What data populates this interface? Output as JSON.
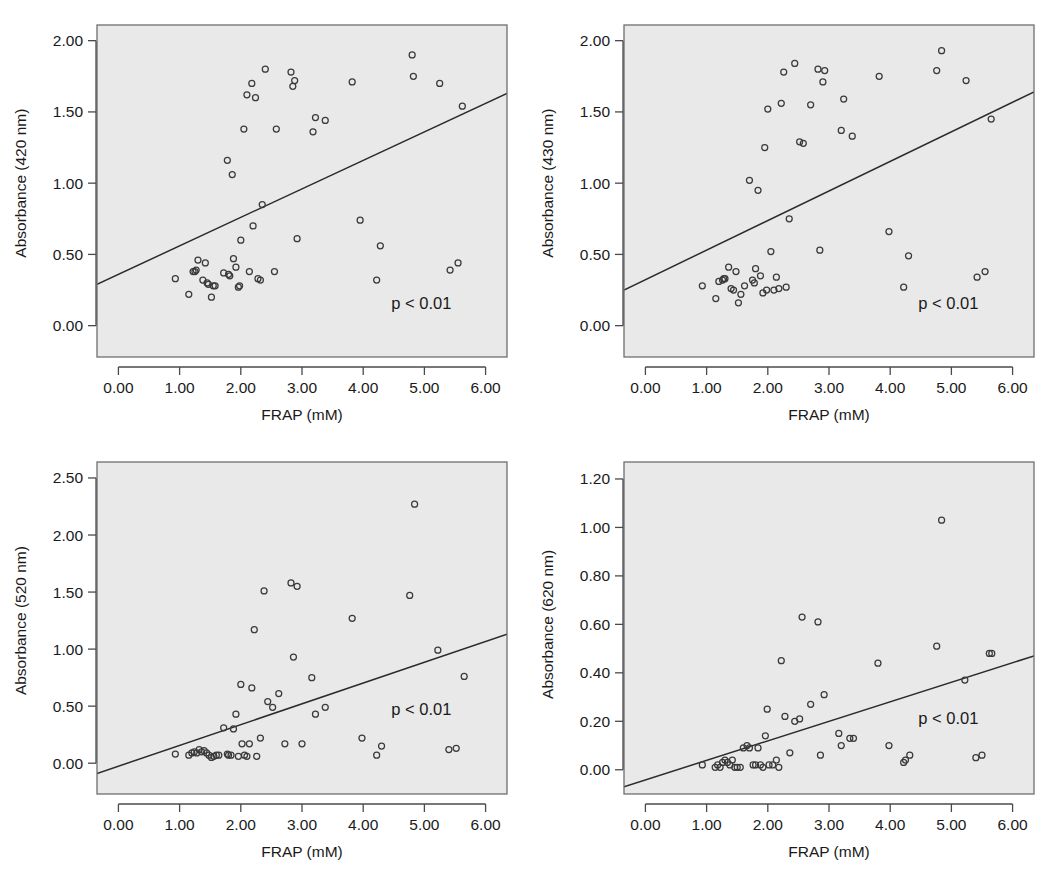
{
  "figure": {
    "name": "four-panel-scatter-figure",
    "panel_count": 4,
    "background_color": "#ffffff",
    "plot_area_color": "#e9e9e9",
    "point_color": "#3a3a3a",
    "line_color": "#2b2b2b"
  },
  "chart_data": [
    {
      "id": "panel-420",
      "type": "scatter",
      "title": "",
      "xlabel": "FRAP (mM)",
      "ylabel": "Absorbance (420 nm)",
      "xlim": [
        -0.35,
        6.35
      ],
      "ylim": [
        -0.22,
        2.11
      ],
      "xticks": [
        0.0,
        1.0,
        2.0,
        3.0,
        4.0,
        5.0,
        6.0
      ],
      "xticklabels": [
        "0.00",
        "1.00",
        "2.00",
        "3.00",
        "4.00",
        "5.00",
        "6.00"
      ],
      "yticks": [
        0.0,
        0.5,
        1.0,
        1.5,
        2.0
      ],
      "yticklabels": [
        "0.00",
        "0.50",
        "1.00",
        "1.50",
        "2.00"
      ],
      "grid": false,
      "legend": "none",
      "annotation": "p < 0.01",
      "annotation_x": 4.95,
      "annotation_y": 0.12,
      "fit_line": {
        "x": [
          -0.35,
          6.35
        ],
        "y": [
          0.29,
          1.63
        ]
      },
      "x": [
        0.93,
        1.15,
        1.22,
        1.25,
        1.27,
        1.3,
        1.38,
        1.42,
        1.45,
        1.47,
        1.52,
        1.55,
        1.58,
        1.72,
        1.78,
        1.8,
        1.82,
        1.86,
        1.88,
        1.92,
        1.96,
        1.98,
        2.0,
        2.05,
        2.1,
        2.14,
        2.18,
        2.2,
        2.24,
        2.28,
        2.32,
        2.35,
        2.4,
        2.55,
        2.58,
        2.82,
        2.85,
        2.88,
        2.92,
        3.18,
        3.22,
        3.38,
        3.82,
        3.95,
        4.22,
        4.28,
        4.8,
        4.82,
        5.25,
        5.42,
        5.55,
        5.62
      ],
      "y": [
        0.33,
        0.22,
        0.38,
        0.38,
        0.39,
        0.46,
        0.32,
        0.44,
        0.3,
        0.29,
        0.2,
        0.28,
        0.28,
        0.37,
        1.16,
        0.36,
        0.35,
        1.06,
        0.47,
        0.41,
        0.27,
        0.28,
        0.6,
        1.38,
        1.62,
        0.38,
        1.7,
        0.7,
        1.6,
        0.33,
        0.32,
        0.85,
        1.8,
        0.38,
        1.38,
        1.78,
        1.68,
        1.72,
        0.61,
        1.36,
        1.46,
        1.44,
        1.71,
        0.74,
        0.32,
        0.56,
        1.9,
        1.75,
        1.7,
        0.39,
        0.44,
        1.54
      ]
    },
    {
      "id": "panel-430",
      "type": "scatter",
      "title": "",
      "xlabel": "FRAP (mM)",
      "ylabel": "Absorbance (430 nm)",
      "xlim": [
        -0.35,
        6.35
      ],
      "ylim": [
        -0.22,
        2.11
      ],
      "xticks": [
        0.0,
        1.0,
        2.0,
        3.0,
        4.0,
        5.0,
        6.0
      ],
      "xticklabels": [
        "0.00",
        "1.00",
        "2.00",
        "3.00",
        "4.00",
        "5.00",
        "6.00"
      ],
      "yticks": [
        0.0,
        0.5,
        1.0,
        1.5,
        2.0
      ],
      "yticklabels": [
        "0.00",
        "0.50",
        "1.00",
        "1.50",
        "2.00"
      ],
      "grid": false,
      "legend": "none",
      "annotation": "p < 0.01",
      "annotation_x": 4.95,
      "annotation_y": 0.12,
      "fit_line": {
        "x": [
          -0.35,
          6.35
        ],
        "y": [
          0.25,
          1.64
        ]
      },
      "x": [
        0.93,
        1.15,
        1.2,
        1.26,
        1.28,
        1.3,
        1.36,
        1.4,
        1.44,
        1.48,
        1.52,
        1.56,
        1.62,
        1.7,
        1.75,
        1.78,
        1.8,
        1.84,
        1.88,
        1.92,
        1.95,
        1.98,
        2.0,
        2.05,
        2.1,
        2.14,
        2.18,
        2.22,
        2.26,
        2.3,
        2.35,
        2.44,
        2.52,
        2.58,
        2.7,
        2.82,
        2.85,
        2.9,
        2.93,
        3.2,
        3.24,
        3.38,
        3.82,
        3.98,
        4.22,
        4.3,
        4.76,
        4.84,
        5.24,
        5.42,
        5.55,
        5.65
      ],
      "y": [
        0.28,
        0.19,
        0.31,
        0.32,
        0.33,
        0.33,
        0.41,
        0.26,
        0.25,
        0.38,
        0.16,
        0.22,
        0.28,
        1.02,
        0.32,
        0.3,
        0.4,
        0.95,
        0.35,
        0.23,
        1.25,
        0.25,
        1.52,
        0.52,
        0.25,
        0.34,
        0.26,
        1.56,
        1.78,
        0.27,
        0.75,
        1.84,
        1.29,
        1.28,
        1.55,
        1.8,
        0.53,
        1.71,
        1.79,
        1.37,
        1.59,
        1.33,
        1.75,
        0.66,
        0.27,
        0.49,
        1.79,
        1.93,
        1.72,
        0.34,
        0.38,
        1.45
      ]
    },
    {
      "id": "panel-520",
      "type": "scatter",
      "title": "",
      "xlabel": "FRAP (mM)",
      "ylabel": "Absorbance (520 nm)",
      "xlim": [
        -0.35,
        6.35
      ],
      "ylim": [
        -0.27,
        2.64
      ],
      "xticks": [
        0.0,
        1.0,
        2.0,
        3.0,
        4.0,
        5.0,
        6.0
      ],
      "xticklabels": [
        "0.00",
        "1.00",
        "2.00",
        "3.00",
        "4.00",
        "5.00",
        "6.00"
      ],
      "yticks": [
        0.0,
        0.5,
        1.0,
        1.5,
        2.0,
        2.5
      ],
      "yticklabels": [
        "0.00",
        "0.50",
        "1.00",
        "1.50",
        "2.00",
        "2.50"
      ],
      "grid": false,
      "legend": "none",
      "annotation": "p < 0.01",
      "annotation_x": 4.95,
      "annotation_y": 0.42,
      "fit_line": {
        "x": [
          -0.35,
          6.35
        ],
        "y": [
          -0.09,
          1.13
        ]
      },
      "x": [
        0.93,
        1.15,
        1.2,
        1.24,
        1.28,
        1.32,
        1.36,
        1.4,
        1.44,
        1.48,
        1.52,
        1.56,
        1.6,
        1.64,
        1.72,
        1.78,
        1.8,
        1.84,
        1.88,
        1.92,
        1.96,
        2.0,
        2.02,
        2.06,
        2.1,
        2.14,
        2.18,
        2.22,
        2.26,
        2.32,
        2.38,
        2.44,
        2.52,
        2.62,
        2.72,
        2.82,
        2.86,
        2.92,
        3.0,
        3.16,
        3.22,
        3.38,
        3.82,
        3.98,
        4.22,
        4.3,
        4.76,
        4.84,
        5.22,
        5.4,
        5.52,
        5.65
      ],
      "y": [
        0.08,
        0.07,
        0.09,
        0.1,
        0.09,
        0.12,
        0.1,
        0.11,
        0.09,
        0.07,
        0.05,
        0.06,
        0.07,
        0.07,
        0.31,
        0.08,
        0.07,
        0.07,
        0.3,
        0.43,
        0.06,
        0.69,
        0.17,
        0.07,
        0.06,
        0.17,
        0.66,
        1.17,
        0.06,
        0.22,
        1.51,
        0.54,
        0.49,
        0.61,
        0.17,
        1.58,
        0.93,
        1.55,
        0.17,
        0.75,
        0.43,
        0.49,
        1.27,
        0.22,
        0.07,
        0.15,
        1.47,
        2.27,
        0.99,
        0.12,
        0.13,
        0.76
      ]
    },
    {
      "id": "panel-620",
      "type": "scatter",
      "title": "",
      "xlabel": "FRAP (mM)",
      "ylabel": "Absorbance (620 nm)",
      "xlim": [
        -0.35,
        6.35
      ],
      "ylim": [
        -0.1,
        1.27
      ],
      "xticks": [
        0.0,
        1.0,
        2.0,
        3.0,
        4.0,
        5.0,
        6.0
      ],
      "xticklabels": [
        "0.00",
        "1.00",
        "2.00",
        "3.00",
        "4.00",
        "5.00",
        "6.00"
      ],
      "yticks": [
        0.0,
        0.2,
        0.4,
        0.6,
        0.8,
        1.0,
        1.2
      ],
      "yticklabels": [
        "0.00",
        "0.20",
        "0.40",
        "0.60",
        "0.80",
        "1.00",
        "1.20"
      ],
      "grid": false,
      "legend": "none",
      "annotation": "p < 0.01",
      "annotation_x": 4.95,
      "annotation_y": 0.19,
      "fit_line": {
        "x": [
          -0.35,
          6.35
        ],
        "y": [
          -0.07,
          0.47
        ]
      },
      "x": [
        0.93,
        1.14,
        1.18,
        1.22,
        1.26,
        1.3,
        1.34,
        1.38,
        1.42,
        1.46,
        1.5,
        1.55,
        1.6,
        1.66,
        1.7,
        1.76,
        1.8,
        1.84,
        1.88,
        1.92,
        1.96,
        1.99,
        2.02,
        2.08,
        2.14,
        2.18,
        2.22,
        2.28,
        2.36,
        2.44,
        2.52,
        2.56,
        2.7,
        2.82,
        2.86,
        2.92,
        3.16,
        3.2,
        3.34,
        3.4,
        3.8,
        3.98,
        4.22,
        4.25,
        4.32,
        4.76,
        4.84,
        5.22,
        5.4,
        5.5,
        5.62,
        5.66
      ],
      "y": [
        0.02,
        0.01,
        0.02,
        0.01,
        0.03,
        0.04,
        0.03,
        0.02,
        0.04,
        0.01,
        0.01,
        0.01,
        0.09,
        0.1,
        0.09,
        0.02,
        0.02,
        0.09,
        0.02,
        0.01,
        0.14,
        0.25,
        0.02,
        0.02,
        0.04,
        0.01,
        0.45,
        0.22,
        0.07,
        0.2,
        0.21,
        0.63,
        0.27,
        0.61,
        0.06,
        0.31,
        0.15,
        0.1,
        0.13,
        0.13,
        0.44,
        0.1,
        0.03,
        0.04,
        0.06,
        0.51,
        1.03,
        0.37,
        0.05,
        0.06,
        0.48,
        0.48
      ]
    }
  ]
}
